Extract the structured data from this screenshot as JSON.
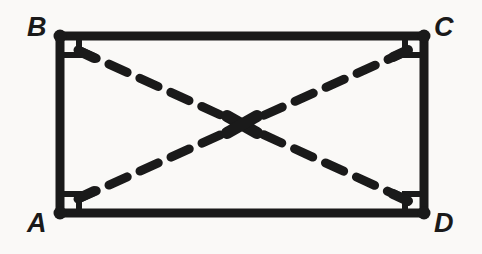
{
  "figure": {
    "shape_type": "rectangle",
    "background_color": "#faf9f7",
    "stroke_color": "#1a1a1a",
    "edge_stroke_width": 9,
    "diagonal_stroke_width": 9,
    "diagonal_style": "dashed",
    "diagonal_dash_pattern": "20 14"
  },
  "vertices": [
    {
      "id": "B",
      "label": "B",
      "position": "top-left",
      "x": 60,
      "y": 36,
      "label_x": 27,
      "label_y": 14
    },
    {
      "id": "C",
      "label": "C",
      "position": "top-right",
      "x": 424,
      "y": 36,
      "label_x": 434,
      "label_y": 14
    },
    {
      "id": "A",
      "label": "A",
      "position": "bottom-left",
      "x": 60,
      "y": 213,
      "label_x": 27,
      "label_y": 210
    },
    {
      "id": "D",
      "label": "D",
      "position": "bottom-right",
      "x": 424,
      "y": 213,
      "label_x": 434,
      "label_y": 210
    }
  ],
  "edges": [
    {
      "id": "BC",
      "name": "top-edge",
      "from": "B",
      "to": "C"
    },
    {
      "id": "CD",
      "name": "right-edge",
      "from": "C",
      "to": "D"
    },
    {
      "id": "AD",
      "name": "bottom-edge",
      "from": "A",
      "to": "D"
    },
    {
      "id": "AB",
      "name": "left-edge",
      "from": "A",
      "to": "B"
    }
  ],
  "diagonals": [
    {
      "id": "BD",
      "name": "diagonal-B-to-D",
      "from": "B",
      "to": "D"
    },
    {
      "id": "AC",
      "name": "diagonal-A-to-C",
      "from": "A",
      "to": "C"
    }
  ],
  "right_angle_marks": [
    {
      "id": "angle-B",
      "at": "B",
      "size": 19
    },
    {
      "id": "angle-C",
      "at": "C",
      "size": 19
    },
    {
      "id": "angle-A",
      "at": "A",
      "size": 19
    },
    {
      "id": "angle-D",
      "at": "D",
      "size": 19
    }
  ],
  "intersection": {
    "id": "center",
    "x": 242,
    "y": 124.5,
    "marked": true
  },
  "geometry": {
    "rect_left": 60,
    "rect_top": 36,
    "rect_right": 424,
    "rect_bottom": 213,
    "width": 364,
    "height": 177
  }
}
